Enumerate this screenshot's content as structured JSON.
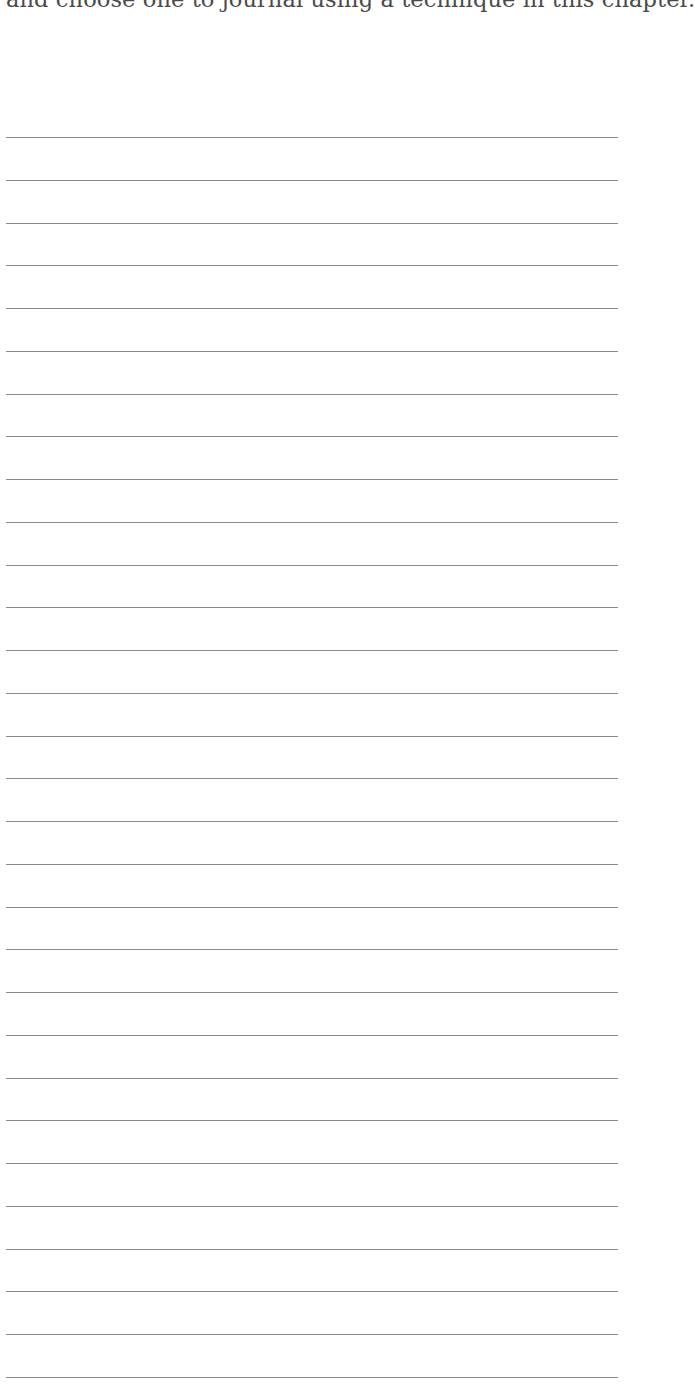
{
  "page": {
    "prompt_text": "and choose one to journal using a technique in this chapter.",
    "writing_lines": {
      "count": 30,
      "first_y": 137,
      "spacing": 42.75,
      "color": "#8a8a8a"
    }
  }
}
